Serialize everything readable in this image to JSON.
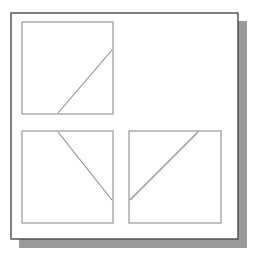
{
  "figure": {
    "canvas": {
      "width": 256,
      "height": 260,
      "background": "#ffffff"
    },
    "shadow": {
      "name": "drop-shadow",
      "color": "#9a9a9a",
      "offset_x": 8,
      "offset_y": 8,
      "x": 19,
      "y": 21,
      "width": 228,
      "height": 227
    },
    "outer_frame": {
      "name": "outer-frame",
      "x": 11,
      "y": 13,
      "width": 227,
      "height": 226,
      "stroke": "#4a4a4a",
      "stroke_width": 1.4,
      "fill": "#ffffff"
    },
    "panel_style": {
      "stroke": "#8c8c8c",
      "stroke_width": 1.1,
      "fill": "#ffffff"
    },
    "line_style": {
      "stroke": "#8a8a8a",
      "stroke_width": 1.1
    },
    "panels": [
      {
        "id": "panel-top-left",
        "label": "Top-left panel",
        "position": "top-left",
        "x": 22,
        "y": 22,
        "width": 91,
        "height": 92,
        "line": {
          "id": "line-top-left",
          "label": "Diagonal line rising to the right",
          "direction": "up-right",
          "slope_sign": "positive",
          "x1": 58,
          "y1": 113,
          "x2": 112,
          "y2": 50
        }
      },
      {
        "id": "panel-bottom-left",
        "label": "Bottom-left panel",
        "position": "bottom-left",
        "x": 22,
        "y": 131,
        "width": 91,
        "height": 92,
        "line": {
          "id": "line-bottom-left",
          "label": "Diagonal line falling to the right",
          "direction": "down-right",
          "slope_sign": "negative",
          "x1": 58,
          "y1": 132,
          "x2": 112,
          "y2": 200
        }
      },
      {
        "id": "panel-bottom-right",
        "label": "Bottom-right panel",
        "position": "bottom-right",
        "x": 129,
        "y": 131,
        "width": 92,
        "height": 92,
        "line": {
          "id": "line-bottom-right",
          "label": "Diagonal line rising to the right",
          "direction": "up-right",
          "slope_sign": "positive",
          "x1": 130,
          "y1": 200,
          "x2": 198,
          "y2": 132
        }
      }
    ]
  }
}
